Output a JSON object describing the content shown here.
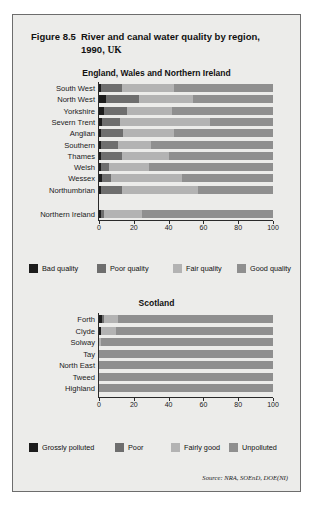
{
  "figure": {
    "number": "Figure 8.5",
    "title_line1": "River and canal water quality by region,",
    "title_line2": "1990,",
    "title_unit": "UK",
    "source": "Source: NRA, SOEnD, DOE(NI)"
  },
  "colors": {
    "panel_bg": "#ececea",
    "panel_border": "#6d6d6d",
    "axis": "#2a2a2a",
    "bad": "#1c1c1c",
    "poor": "#6e6e6e",
    "fair": "#b3b3b3",
    "good": "#8f8f8f"
  },
  "chart_data": [
    {
      "type": "bar",
      "orientation": "horizontal",
      "stacked": true,
      "percent": true,
      "title": "England, Wales and Northern Ireland",
      "xlabel": "",
      "ylabel": "",
      "xlim": [
        0,
        100
      ],
      "xticks": [
        "0",
        "20",
        "40",
        "60",
        "80",
        "100"
      ],
      "grid": false,
      "legend_position": "bottom",
      "categories": [
        "South West",
        "North West",
        "Yorkshire",
        "Severn Trent",
        "Anglian",
        "Southern",
        "Thames",
        "Welsh",
        "Wessex",
        "Northumbrian",
        "Northern Ireland"
      ],
      "series": [
        {
          "name": "Bad quality",
          "values": [
            1,
            4,
            3,
            2,
            1,
            1,
            1,
            1,
            2,
            1,
            1
          ]
        },
        {
          "name": "Poor quality",
          "values": [
            12,
            19,
            13,
            10,
            13,
            10,
            12,
            5,
            5,
            12,
            2
          ]
        },
        {
          "name": "Fair quality",
          "values": [
            30,
            31,
            26,
            52,
            29,
            19,
            27,
            23,
            41,
            44,
            22
          ]
        },
        {
          "name": "Good quality",
          "values": [
            57,
            46,
            58,
            36,
            57,
            70,
            60,
            71,
            52,
            43,
            75
          ]
        }
      ],
      "legend": [
        "Bad quality",
        "Poor quality",
        "Fair quality",
        "Good quality"
      ]
    },
    {
      "type": "bar",
      "orientation": "horizontal",
      "stacked": true,
      "percent": true,
      "title": "Scotland",
      "xlabel": "",
      "ylabel": "",
      "xlim": [
        0,
        100
      ],
      "xticks": [
        "0",
        "20",
        "40",
        "60",
        "80",
        "100"
      ],
      "grid": false,
      "legend_position": "bottom",
      "categories": [
        "Forth",
        "Clyde",
        "Solway",
        "Tay",
        "North East",
        "Tweed",
        "Highland"
      ],
      "series": [
        {
          "name": "Grossly polluted",
          "values": [
            2,
            1,
            0,
            0,
            0,
            0,
            0
          ]
        },
        {
          "name": "Poor",
          "values": [
            1,
            0,
            0,
            0,
            0,
            0,
            0
          ]
        },
        {
          "name": "Fairly good",
          "values": [
            8,
            9,
            1,
            0,
            0,
            0,
            0
          ]
        },
        {
          "name": "Unpolluted",
          "values": [
            89,
            90,
            99,
            100,
            100,
            100,
            100
          ]
        }
      ],
      "legend": [
        "Grossly polluted",
        "Poor",
        "Fairly good",
        "Unpolluted"
      ]
    }
  ]
}
